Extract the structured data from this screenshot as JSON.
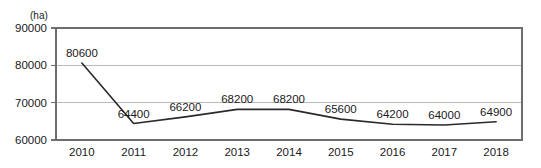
{
  "chart_data": {
    "type": "line",
    "title": "",
    "subtitle": "",
    "xlabel": "",
    "ylabel": "",
    "unit_label": "(ha)",
    "categories": [
      "2010",
      "2011",
      "2012",
      "2013",
      "2014",
      "2015",
      "2016",
      "2017",
      "2018"
    ],
    "values": [
      80600,
      64400,
      66200,
      68200,
      68200,
      65600,
      64200,
      64000,
      64900
    ],
    "point_labels": [
      "80600",
      "64400",
      "66200",
      "68200",
      "68200",
      "65600",
      "64200",
      "64000",
      "64900"
    ],
    "ylim": [
      60000,
      90000
    ],
    "yticks": [
      90000,
      80000,
      70000,
      60000
    ],
    "ytick_labels": [
      "90000",
      "80000",
      "70000",
      "60000"
    ],
    "grid": true,
    "grid_axis": "y",
    "legend": false,
    "legend_position": "none",
    "series": [
      {
        "name": "area",
        "values": [
          80600,
          64400,
          66200,
          68200,
          68200,
          65600,
          64200,
          64000,
          64900
        ]
      }
    ],
    "colors": {
      "line": "#2a2a2a",
      "grid": "#b9b9b9",
      "axis": "#6d6d6d",
      "text": "#1a1a1a",
      "background": "#ffffff"
    }
  }
}
